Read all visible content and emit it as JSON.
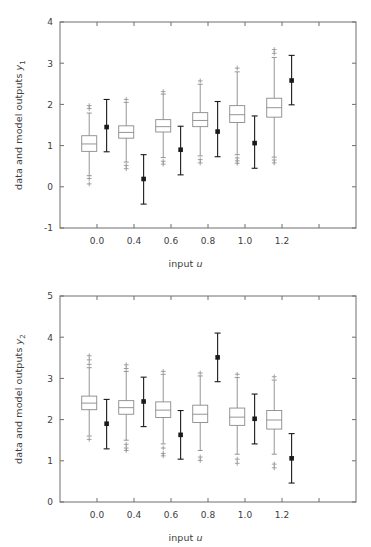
{
  "figure": {
    "background": "#ffffff",
    "box_color": "#8a8a8a",
    "marker_color": "#1a1a1a",
    "axis_color": "#6e6e6e",
    "text_color": "#3d3d3d"
  },
  "chart_data": [
    {
      "type": "box",
      "panel": "top",
      "title": "",
      "xlabel_prefix": "input ",
      "xlabel_symbol": "u",
      "ylabel_prefix": "data and model outputs ",
      "ylabel_symbol": "y",
      "ylabel_subscript": "1",
      "xlim": [
        -0.2,
        1.4
      ],
      "ylim": [
        -1,
        4
      ],
      "yticks": [
        -1,
        0,
        1,
        2,
        3,
        4
      ],
      "ytick_labels": [
        "-1",
        "0",
        "1",
        "2",
        "3",
        "4"
      ],
      "xticks": [
        0.0,
        0.2,
        0.4,
        0.6,
        0.8,
        1.0,
        1.2
      ],
      "xtick_labels": [
        "0.0",
        "",
        "0.4",
        "0.6",
        "0.8",
        "1.0",
        "1.2"
      ],
      "xtick_labels_shown": [
        "0.0",
        "0.4",
        "0.6",
        "0.8",
        "1.0",
        "1.2"
      ],
      "grid": false,
      "legend": "none",
      "box_series_name": "data",
      "marker_series_name": "model output",
      "groups": [
        {
          "x": 0.0,
          "box": {
            "whisker_low": 0.27,
            "q1": 0.86,
            "median": 1.04,
            "q3": 1.24,
            "whisker_high": 1.79,
            "outliers_high": [
              1.9,
              1.97
            ],
            "outliers_low": [
              0.2,
              0.07
            ]
          },
          "marker": {
            "value": 1.45,
            "low": 0.85,
            "high": 2.12
          }
        },
        {
          "x": 0.2,
          "box": {
            "whisker_low": 0.6,
            "q1": 1.18,
            "median": 1.32,
            "q3": 1.48,
            "whisker_high": 2.05,
            "outliers_high": [
              2.12
            ],
            "outliers_low": [
              0.52,
              0.44
            ]
          },
          "marker": {
            "value": 0.19,
            "low": -0.42,
            "high": 0.78
          }
        },
        {
          "x": 0.4,
          "box": {
            "whisker_low": 0.71,
            "q1": 1.33,
            "median": 1.46,
            "q3": 1.63,
            "whisker_high": 2.25,
            "outliers_high": [
              2.31
            ],
            "outliers_low": [
              0.62,
              0.55
            ]
          },
          "marker": {
            "value": 0.9,
            "low": 0.29,
            "high": 1.47
          }
        },
        {
          "x": 0.6,
          "box": {
            "whisker_low": 0.75,
            "q1": 1.46,
            "median": 1.61,
            "q3": 1.8,
            "whisker_high": 2.49,
            "outliers_high": [
              2.57
            ],
            "outliers_low": [
              0.66,
              0.58
            ]
          },
          "marker": {
            "value": 1.34,
            "low": 0.73,
            "high": 2.07
          }
        },
        {
          "x": 0.8,
          "box": {
            "whisker_low": 0.78,
            "q1": 1.56,
            "median": 1.75,
            "q3": 1.97,
            "whisker_high": 2.79,
            "outliers_high": [
              2.88
            ],
            "outliers_low": [
              0.7,
              0.63,
              0.57
            ]
          },
          "marker": {
            "value": 1.06,
            "low": 0.45,
            "high": 1.72
          }
        },
        {
          "x": 1.0,
          "box": {
            "whisker_low": 0.72,
            "q1": 1.69,
            "median": 1.92,
            "q3": 2.15,
            "whisker_high": 3.14,
            "outliers_high": [
              3.24,
              3.33
            ],
            "outliers_low": [
              0.65,
              0.58
            ]
          },
          "marker": {
            "value": 2.58,
            "low": 1.99,
            "high": 3.19
          }
        }
      ]
    },
    {
      "type": "box",
      "panel": "bottom",
      "title": "",
      "xlabel_prefix": "input ",
      "xlabel_symbol": "u",
      "ylabel_prefix": "data and model outputs ",
      "ylabel_symbol": "y",
      "ylabel_subscript": "2",
      "xlim": [
        -0.2,
        1.4
      ],
      "ylim": [
        0,
        5
      ],
      "yticks": [
        0,
        1,
        2,
        3,
        4,
        5
      ],
      "ytick_labels": [
        "0",
        "1",
        "2",
        "3",
        "4",
        "5"
      ],
      "xticks": [
        0.0,
        0.2,
        0.4,
        0.6,
        0.8,
        1.0,
        1.2
      ],
      "xtick_labels_shown": [
        "0.0",
        "0.4",
        "0.6",
        "0.8",
        "1.0",
        "1.2"
      ],
      "grid": false,
      "legend": "none",
      "box_series_name": "data",
      "marker_series_name": "model output",
      "groups": [
        {
          "x": 0.0,
          "box": {
            "whisker_low": 1.6,
            "q1": 2.24,
            "median": 2.4,
            "q3": 2.57,
            "whisker_high": 3.26,
            "outliers_high": [
              3.34,
              3.45,
              3.55
            ],
            "outliers_low": [
              1.52
            ]
          },
          "marker": {
            "value": 1.9,
            "low": 1.29,
            "high": 2.49
          }
        },
        {
          "x": 0.2,
          "box": {
            "whisker_low": 1.5,
            "q1": 2.13,
            "median": 2.29,
            "q3": 2.46,
            "whisker_high": 3.17,
            "outliers_high": [
              3.24,
              3.33
            ],
            "outliers_low": [
              1.4,
              1.31,
              1.25
            ]
          },
          "marker": {
            "value": 2.44,
            "low": 1.83,
            "high": 3.03
          }
        },
        {
          "x": 0.4,
          "box": {
            "whisker_low": 1.41,
            "q1": 2.05,
            "median": 2.23,
            "q3": 2.43,
            "whisker_high": 3.1,
            "outliers_high": [
              3.17
            ],
            "outliers_low": [
              1.31,
              1.18,
              1.12
            ]
          },
          "marker": {
            "value": 1.63,
            "low": 1.04,
            "high": 2.22
          }
        },
        {
          "x": 0.6,
          "box": {
            "whisker_low": 1.25,
            "q1": 1.93,
            "median": 2.13,
            "q3": 2.35,
            "whisker_high": 3.06,
            "outliers_high": [
              3.13
            ],
            "outliers_low": [
              1.09,
              1.01
            ]
          },
          "marker": {
            "value": 3.51,
            "low": 2.92,
            "high": 4.1
          }
        },
        {
          "x": 0.8,
          "box": {
            "whisker_low": 1.16,
            "q1": 1.86,
            "median": 2.06,
            "q3": 2.28,
            "whisker_high": 3.02,
            "outliers_high": [
              3.1
            ],
            "outliers_low": [
              1.04,
              0.94
            ]
          },
          "marker": {
            "value": 2.02,
            "low": 1.41,
            "high": 2.62
          }
        },
        {
          "x": 1.0,
          "box": {
            "whisker_low": 1.16,
            "q1": 1.77,
            "median": 1.99,
            "q3": 2.22,
            "whisker_high": 2.96,
            "outliers_high": [
              3.04
            ],
            "outliers_low": [
              0.92,
              0.83
            ]
          },
          "marker": {
            "value": 1.06,
            "low": 0.46,
            "high": 1.66
          }
        }
      ]
    }
  ]
}
